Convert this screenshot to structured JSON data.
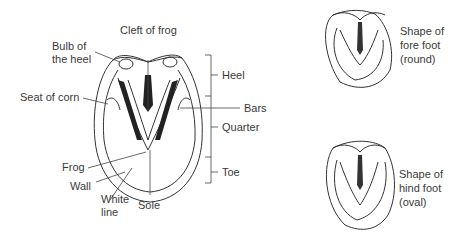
{
  "diagram": {
    "main_hoof": {
      "labels": {
        "cleft_of_frog": "Cleft of frog",
        "bulb_of_heel_1": "Bulb of",
        "bulb_of_heel_2": "the heel",
        "seat_of_corn": "Seat of corn",
        "frog": "Frog",
        "wall": "Wall",
        "white_line_1": "White",
        "white_line_2": "line",
        "sole": "Sole",
        "heel": "Heel",
        "bars": "Bars",
        "quarter": "Quarter",
        "toe": "Toe"
      }
    },
    "fore_foot": {
      "line1": "Shape of",
      "line2": "fore foot",
      "line3": "(round)"
    },
    "hind_foot": {
      "line1": "Shape of",
      "line2": "hind foot",
      "line3": "(oval)"
    }
  }
}
